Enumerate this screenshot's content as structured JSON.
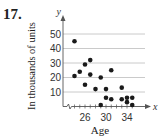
{
  "problem_number": "17.",
  "chart_data": {
    "type": "scatter",
    "title": "",
    "xlabel": "Age",
    "ylabel": "In thousands of units",
    "x_axis_symbol": "x",
    "y_axis_symbol": "y",
    "x_ticks": [
      26,
      30,
      34
    ],
    "y_ticks": [
      10,
      20,
      30,
      40,
      50
    ],
    "xlim": [
      22,
      37
    ],
    "ylim": [
      0,
      55
    ],
    "grid": "horizontal",
    "x_axis_break": true,
    "points": [
      {
        "x": 24,
        "y": 45
      },
      {
        "x": 24,
        "y": 21
      },
      {
        "x": 25,
        "y": 24
      },
      {
        "x": 26,
        "y": 29
      },
      {
        "x": 26,
        "y": 15
      },
      {
        "x": 27,
        "y": 32
      },
      {
        "x": 27,
        "y": 22
      },
      {
        "x": 28,
        "y": 12
      },
      {
        "x": 29,
        "y": 20
      },
      {
        "x": 29,
        "y": 1
      },
      {
        "x": 30,
        "y": 12
      },
      {
        "x": 30,
        "y": 6
      },
      {
        "x": 31,
        "y": 25
      },
      {
        "x": 31,
        "y": 5
      },
      {
        "x": 33,
        "y": 13
      },
      {
        "x": 33,
        "y": 5
      },
      {
        "x": 34,
        "y": 6
      },
      {
        "x": 34,
        "y": 3
      },
      {
        "x": 35,
        "y": 6
      },
      {
        "x": 35,
        "y": 1
      }
    ]
  },
  "colors": {
    "grid": "#bdbdbd",
    "axis": "#555555",
    "point": "#1a1a1a"
  }
}
